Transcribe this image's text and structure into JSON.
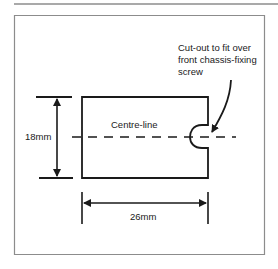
{
  "diagram": {
    "labels": {
      "height_dimension": "18mm",
      "width_dimension": "26mm",
      "centre_line": "Centre-line",
      "cutout_note_line1": "Cut-out to fit over",
      "cutout_note_line2": "front chassis-fixing",
      "cutout_note_line3": "screw"
    },
    "dimensions": {
      "height_mm": 18,
      "width_mm": 26
    },
    "colors": {
      "ink": "#1a1a1a",
      "frame": "#8c8c8c",
      "background": "#ffffff"
    }
  }
}
